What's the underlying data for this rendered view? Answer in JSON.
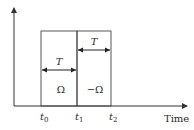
{
  "diagram": {
    "x_axis_label": "Time",
    "tick_labels": {
      "t0": {
        "base": "t",
        "sub": "0"
      },
      "t1": {
        "base": "t",
        "sub": "1"
      },
      "t2": {
        "base": "t",
        "sub": "2"
      }
    },
    "intervals": [
      {
        "duration_label": "T",
        "value_label": "Ω",
        "from": "t0",
        "to": "t1"
      },
      {
        "duration_label": "T",
        "value_label": "−Ω",
        "from": "t1",
        "to": "t2"
      }
    ],
    "colors": {
      "line": "#333333",
      "background": "#ffffff"
    }
  }
}
